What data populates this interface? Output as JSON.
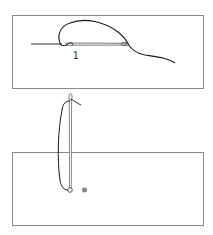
{
  "diagram": {
    "type": "sewing-stitch-instructions",
    "panels": [
      {
        "id": "panel-1",
        "description": "Horizontal needle through fabric with thread loop",
        "label": "1"
      },
      {
        "id": "panel-2",
        "description": "Vertical needle pulled up through fabric with thread loop and marker dots"
      }
    ],
    "colors": {
      "outline": "#8a8a8a",
      "thread": "#1a1a1a",
      "needle": "#555555",
      "dot": "#888888",
      "background": "#ffffff"
    }
  }
}
